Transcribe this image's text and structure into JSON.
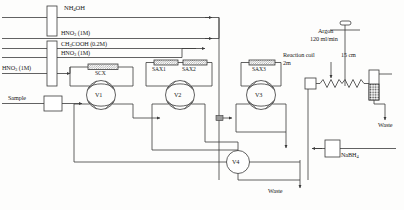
{
  "diagram": {
    "reagents": {
      "nh4oh": "NH4OH",
      "hno3_top": "HNO3 (1M)",
      "ch3cooh": "CH3COOH (0.2M)",
      "hno3_mid": "HNO3 (1M)",
      "hno3_left": "HNO3 (1M)",
      "sample": "Sample",
      "nabh4": "NaBH4"
    },
    "columns": {
      "scx": "SCX",
      "sax1": "SAX1",
      "sax2": "SAX2",
      "sax3": "SAX3"
    },
    "valves": {
      "v1": "V1",
      "v2": "V2",
      "v3": "V3",
      "v4": "V4"
    },
    "gas": {
      "carrier": "Argon",
      "flow": "120 ml/min",
      "separator_length": "15 cm"
    },
    "coil": {
      "name": "Reaction coil",
      "length": "2m"
    },
    "waste": {
      "right": "Waste",
      "bottom": "Waste"
    },
    "colors": {
      "line": "#3a3a3a",
      "text": "#1a1a1a",
      "background": "#fdfdfc"
    }
  }
}
